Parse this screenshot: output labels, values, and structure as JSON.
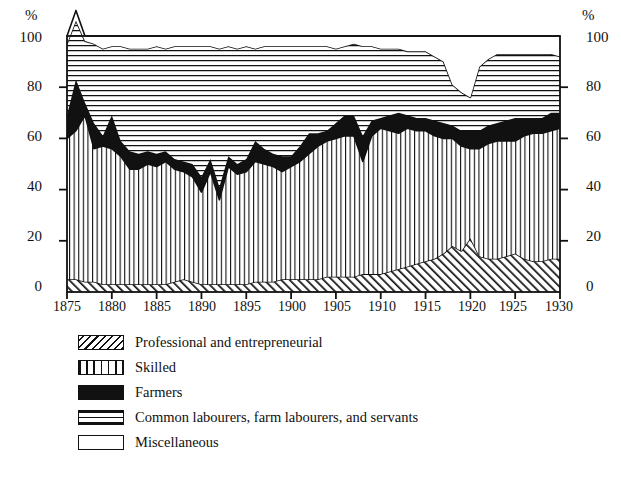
{
  "axes": {
    "unit_left": "%",
    "unit_right": "%",
    "y_ticks": [
      "100",
      "80",
      "60",
      "40",
      "20",
      "0"
    ],
    "y_tick_values": [
      100,
      80,
      60,
      40,
      20,
      0
    ],
    "x_ticks": [
      "1875",
      "1880",
      "1885",
      "1890",
      "1895",
      "1900",
      "1905",
      "1910",
      "1915",
      "1920",
      "1925",
      "1930"
    ],
    "x_tick_values": [
      1875,
      1880,
      1885,
      1890,
      1895,
      1900,
      1905,
      1910,
      1915,
      1920,
      1925,
      1930
    ]
  },
  "legend": {
    "items": [
      {
        "label": "Professional and entrepreneurial",
        "pattern": "diagonal-hatch",
        "swatch_class": "sw-diag"
      },
      {
        "label": "Skilled",
        "pattern": "vertical-lines",
        "swatch_class": "sw-vert"
      },
      {
        "label": "Farmers",
        "pattern": "solid-black",
        "swatch_class": "sw-solid"
      },
      {
        "label": "Common labourers, farm labourers, and servants",
        "pattern": "horizontal-lines",
        "swatch_class": "sw-horiz"
      },
      {
        "label": "Miscellaneous",
        "pattern": "blank",
        "swatch_class": "sw-blank"
      }
    ]
  },
  "chart_data": {
    "type": "area",
    "title": "",
    "subtitle": "",
    "xlabel": "",
    "ylabel": "%",
    "ylabel_right": "%",
    "xlim": [
      1875,
      1930
    ],
    "ylim": [
      0,
      100
    ],
    "grid": false,
    "stacked": true,
    "stack_order_bottom_to_top": [
      "Professional and entrepreneurial",
      "Skilled",
      "Farmers",
      "Common labourers, farm labourers, and servants",
      "Miscellaneous"
    ],
    "legend_position": "below-plot-left",
    "x": [
      1875,
      1876,
      1877,
      1878,
      1879,
      1880,
      1881,
      1882,
      1883,
      1884,
      1885,
      1886,
      1887,
      1888,
      1889,
      1890,
      1891,
      1892,
      1893,
      1894,
      1895,
      1896,
      1897,
      1898,
      1899,
      1900,
      1901,
      1902,
      1903,
      1904,
      1905,
      1906,
      1907,
      1908,
      1909,
      1910,
      1911,
      1912,
      1913,
      1914,
      1915,
      1916,
      1917,
      1918,
      1919,
      1920,
      1921,
      1922,
      1923,
      1924,
      1925,
      1926,
      1927,
      1928,
      1929,
      1930
    ],
    "series": [
      {
        "name": "Professional and entrepreneurial",
        "pattern": "diagonal-hatch",
        "values": [
          5,
          5,
          4,
          4,
          3,
          3,
          3,
          3,
          3,
          3,
          3,
          3,
          4,
          5,
          4,
          3,
          3,
          3,
          3,
          3,
          3,
          4,
          4,
          4,
          5,
          5,
          5,
          5,
          5,
          6,
          6,
          6,
          6,
          7,
          7,
          7,
          8,
          9,
          10,
          11,
          12,
          13,
          15,
          18,
          16,
          21,
          14,
          13,
          13,
          14,
          15,
          13,
          12,
          12,
          13,
          13
        ]
      },
      {
        "name": "Skilled",
        "pattern": "vertical-lines",
        "values": [
          55,
          58,
          65,
          52,
          54,
          53,
          50,
          45,
          45,
          47,
          46,
          48,
          44,
          42,
          41,
          36,
          44,
          33,
          46,
          43,
          44,
          47,
          46,
          45,
          42,
          44,
          46,
          49,
          52,
          53,
          54,
          55,
          55,
          44,
          54,
          57,
          55,
          53,
          54,
          52,
          51,
          48,
          45,
          42,
          41,
          35,
          42,
          45,
          46,
          45,
          44,
          48,
          50,
          50,
          50,
          51
        ]
      },
      {
        "name": "Farmers",
        "pattern": "solid-black",
        "values": [
          9,
          20,
          5,
          10,
          4,
          13,
          6,
          7,
          6,
          5,
          5,
          4,
          4,
          4,
          5,
          6,
          5,
          5,
          4,
          4,
          5,
          8,
          6,
          5,
          6,
          4,
          6,
          8,
          5,
          4,
          6,
          8,
          8,
          10,
          6,
          4,
          6,
          8,
          5,
          5,
          5,
          6,
          6,
          5,
          6,
          7,
          7,
          7,
          7,
          8,
          9,
          7,
          6,
          6,
          7,
          6
        ]
      },
      {
        "name": "Common labourers, farm labourers, and servants",
        "pattern": "horizontal-lines",
        "values": [
          28,
          23,
          24,
          31,
          34,
          27,
          37,
          40,
          41,
          40,
          42,
          40,
          44,
          45,
          46,
          51,
          44,
          54,
          43,
          45,
          44,
          36,
          40,
          42,
          43,
          43,
          39,
          34,
          34,
          33,
          29,
          27,
          28,
          35,
          29,
          27,
          26,
          25,
          25,
          26,
          26,
          25,
          24,
          16,
          15,
          13,
          25,
          26,
          27,
          26,
          25,
          25,
          25,
          25,
          23,
          22
        ]
      },
      {
        "name": "Miscellaneous",
        "pattern": "blank",
        "values": [
          3,
          4,
          2,
          3,
          5,
          4,
          4,
          5,
          5,
          5,
          4,
          5,
          4,
          4,
          4,
          4,
          4,
          5,
          4,
          5,
          4,
          5,
          4,
          4,
          4,
          4,
          4,
          4,
          4,
          4,
          5,
          4,
          3,
          4,
          4,
          5,
          5,
          5,
          6,
          6,
          6,
          8,
          10,
          19,
          22,
          24,
          12,
          9,
          7,
          7,
          7,
          7,
          7,
          7,
          7,
          8
        ]
      }
    ]
  }
}
